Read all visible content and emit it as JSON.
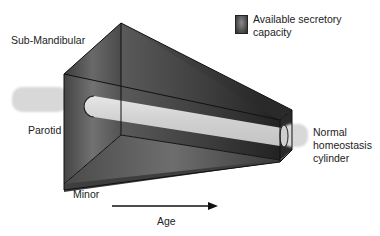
{
  "legend": {
    "label_line1": "Available secretory",
    "label_line2": "capacity",
    "swatch_color": "#555555"
  },
  "labels": {
    "sub_mandibular": "Sub-Mandibular",
    "parotid": "Parotid",
    "minor": "Minor",
    "cylinder_line1": "Normal",
    "cylinder_line2": "homeostasis",
    "cylinder_line3": "cylinder",
    "age": "Age"
  },
  "colors": {
    "prism_dark": "#2e2e2e",
    "prism_mid": "#5a5a5a",
    "prism_light": "#8c8c8c",
    "cylinder": "#d6d6d6",
    "edge": "#111111"
  }
}
